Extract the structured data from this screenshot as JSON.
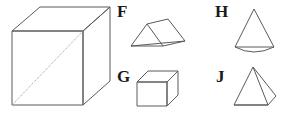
{
  "figure": {
    "background_color": "#ffffff",
    "stroke_color": "#5a5a5a",
    "label_color": "#1a1a1a",
    "width": 285,
    "height": 118,
    "labels": {
      "F": "F",
      "G": "G",
      "H": "H",
      "J": "J"
    },
    "shapes": [
      {
        "id": "main-cube",
        "label": "",
        "name": "large-cube",
        "description": "Large cube drawn in oblique projection with a dotted diagonal across the front face from bottom-left to top-right"
      },
      {
        "id": "shape-f",
        "label": "F",
        "name": "triangular-prism",
        "description": "Triangular prism (tent / wedge) lying on its rectangular base"
      },
      {
        "id": "shape-g",
        "label": "G",
        "name": "small-cube",
        "description": "Small cube drawn in oblique projection"
      },
      {
        "id": "shape-h",
        "label": "H",
        "name": "cone",
        "description": "Cone with elliptical base arc and apex at the top"
      },
      {
        "id": "shape-j",
        "label": "J",
        "name": "pyramid",
        "description": "Square-based pyramid viewed from a corner with a visible lateral edge"
      }
    ]
  }
}
